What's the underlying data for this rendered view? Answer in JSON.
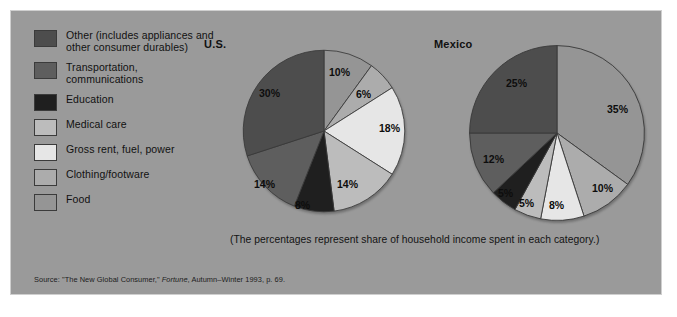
{
  "figure": {
    "background_color": "#9a9a9a",
    "caption": "(The percentages represent share of household income spent in each category.)",
    "source_prefix": "Source: \"The New Global Consumer,\" ",
    "source_italic": "Fortune",
    "source_suffix": ", Autumn–Winter 1993, p. 69."
  },
  "legend": {
    "items": [
      {
        "label": "Other (includes appliances and other consumer durables)",
        "color": "#4d4d4d"
      },
      {
        "label": "Transportation, communications",
        "color": "#5e5e5e"
      },
      {
        "label": "Education",
        "color": "#1f1f1f"
      },
      {
        "label": "Medical care",
        "color": "#bcbcbc"
      },
      {
        "label": "Gross rent, fuel, power",
        "color": "#e6e6e6"
      },
      {
        "label": "Clothing/footware",
        "color": "#acacac"
      },
      {
        "label": "Food",
        "color": "#959595"
      }
    ]
  },
  "chart_data": [
    {
      "type": "pie",
      "title": "U.S.",
      "categories": [
        "Food",
        "Clothing/footware",
        "Gross rent, fuel, power",
        "Medical care",
        "Education",
        "Transportation, communications",
        "Other (includes appliances and other consumer durables)"
      ],
      "values": [
        10,
        6,
        18,
        14,
        8,
        14,
        30
      ],
      "labels": [
        "10%",
        "6%",
        "18%",
        "14%",
        "8%",
        "14%",
        "30%"
      ],
      "colors": [
        "#959595",
        "#acacac",
        "#e6e6e6",
        "#bcbcbc",
        "#1f1f1f",
        "#5e5e5e",
        "#4d4d4d"
      ],
      "start_angle_deg": 0,
      "direction": "clockwise",
      "units": "percent of household income"
    },
    {
      "type": "pie",
      "title": "Mexico",
      "categories": [
        "Food",
        "Clothing/footware",
        "Gross rent, fuel, power",
        "Medical care",
        "Education",
        "Transportation, communications",
        "Other (includes appliances and other consumer durables)"
      ],
      "values": [
        35,
        10,
        8,
        5,
        5,
        12,
        25
      ],
      "labels": [
        "35%",
        "10%",
        "8%",
        "5%",
        "5%",
        "12%",
        "25%"
      ],
      "colors": [
        "#959595",
        "#acacac",
        "#e6e6e6",
        "#bcbcbc",
        "#1f1f1f",
        "#5e5e5e",
        "#4d4d4d"
      ],
      "start_angle_deg": 0,
      "direction": "clockwise",
      "units": "percent of household income"
    }
  ],
  "us_labels": {
    "l0": "10%",
    "l1": "6%",
    "l2": "18%",
    "l3": "14%",
    "l4": "8%",
    "l5": "14%",
    "l6": "30%"
  },
  "mx_labels": {
    "l0": "35%",
    "l1": "10%",
    "l2": "8%",
    "l3": "5%",
    "l4": "5%",
    "l5": "12%",
    "l6": "25%"
  }
}
